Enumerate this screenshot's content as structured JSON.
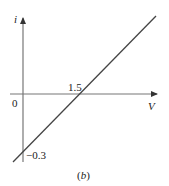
{
  "chart_data": {
    "type": "line",
    "title": "",
    "xlabel": "V",
    "ylabel": "i",
    "caption": "(b)",
    "origin_label": "0",
    "annotations": [
      {
        "text": "1.5",
        "at": "x-intercept"
      },
      {
        "text": "−0.3",
        "at": "y-intercept"
      }
    ],
    "series": [
      {
        "name": "i-V characteristic",
        "x": [
          0,
          1.5
        ],
        "y": [
          -0.3,
          0
        ],
        "slope": 0.2,
        "intercept": -0.3
      }
    ],
    "x_intercept": 1.5,
    "y_intercept": -0.3,
    "grid": false,
    "legend": "none",
    "axis_arrows": true
  },
  "labels": {
    "y_axis": "i",
    "x_axis": "V",
    "origin": "0",
    "x_intercept": "1.5",
    "y_intercept": "−0.3",
    "caption": "(b)"
  },
  "colors": {
    "axis": "#777777",
    "line": "#444444",
    "text": "#222222"
  }
}
